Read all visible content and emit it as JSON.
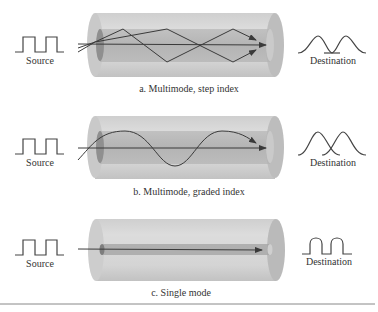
{
  "figure": {
    "panels": [
      {
        "id": "a",
        "caption": "a. Multimode, step index",
        "source_label": "Source",
        "destination_label": "Destination",
        "source_signal": "square-pulses",
        "destination_signal": "broadened-overlapping-pulses",
        "ray_pattern": "zigzag-reflections"
      },
      {
        "id": "b",
        "caption": "b. Multimode, graded index",
        "source_label": "Source",
        "destination_label": "Destination",
        "source_signal": "square-pulses",
        "destination_signal": "rounded-slightly-overlapping-pulses",
        "ray_pattern": "sinusoidal-curve"
      },
      {
        "id": "c",
        "caption": "c. Single mode",
        "source_label": "Source",
        "destination_label": "Destination",
        "source_signal": "square-pulses",
        "destination_signal": "rounded-square-pulses",
        "ray_pattern": "single-straight-ray"
      }
    ],
    "colors": {
      "cladding": "#d2d2d2",
      "cladding_end": "#bdbdbd",
      "core": "#a9a9a9",
      "ray": "#3a3a3a",
      "text": "#333333",
      "rule": "#888888"
    }
  }
}
